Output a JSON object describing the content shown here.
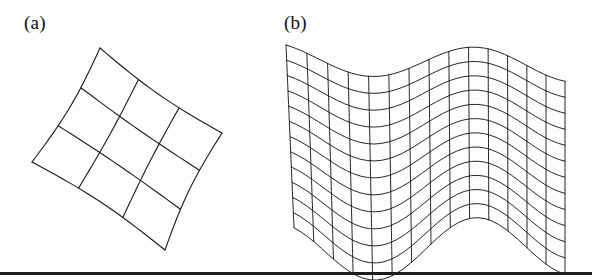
{
  "figure": {
    "background_color": "#fdfdfd",
    "ink_color": "#1a1a1a",
    "width": 592,
    "height": 280,
    "panels": [
      {
        "id": "panel-a",
        "label": "(a)",
        "label_x": 24,
        "label_y": 12,
        "kind": "curved-quadrilateral-mesh",
        "description": "Rotated, gently bulging 3 x 3 quadrilateral patch mesh",
        "rows": 3,
        "cols": 3,
        "corners": {
          "top": [
            100,
            48
          ],
          "right": [
            222,
            133
          ],
          "bottom": [
            165,
            250
          ],
          "left": [
            32,
            162
          ]
        },
        "bulge": 9,
        "stroke_width": 1.1
      },
      {
        "id": "panel-b",
        "label": "(b)",
        "label_x": 284,
        "label_y": 12,
        "kind": "wavy-surface-mesh",
        "description": "Dense sinusoidal flag-like surface mesh drawn in oblique projection",
        "rows": 12,
        "cols": 14,
        "bounds": {
          "x_left": 300,
          "x_right": 565,
          "y_top": 58,
          "y_bottom": 252
        },
        "wave": {
          "amplitude_top": 26,
          "amplitude_bottom": 30,
          "periods": 1.35,
          "phase": 0.35,
          "skew_y": 36
        },
        "stroke_width": 0.95
      }
    ],
    "bottom_rule": {
      "y": 272,
      "height": 3,
      "color": "#1b1b1b"
    }
  }
}
